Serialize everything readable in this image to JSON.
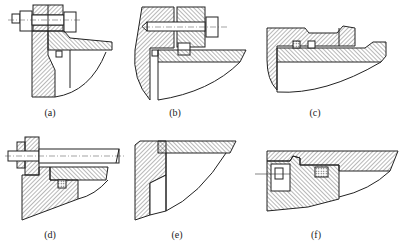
{
  "figure": {
    "panels": [
      {
        "id": "a",
        "label": "(a)",
        "content": "bolted flange with through-bolt, nut and square seal groove"
      },
      {
        "id": "b",
        "label": "(b)",
        "content": "stud bolt into housing with spacer and square seal at corner"
      },
      {
        "id": "c",
        "label": "(c)",
        "content": "stepped sleeve with two seal rings in grooves"
      },
      {
        "id": "d",
        "label": "(d)",
        "content": "long bolt with nut through flange, square seal groove"
      },
      {
        "id": "e",
        "label": "(e)",
        "content": "L-shaped housing corner with tapered recess, no fasteners"
      },
      {
        "id": "f",
        "label": "(f)",
        "content": "cover with socket-head screw and cross-hatched seal insert"
      }
    ]
  },
  "colors": {
    "line": "#222222",
    "background": "#ffffff"
  }
}
